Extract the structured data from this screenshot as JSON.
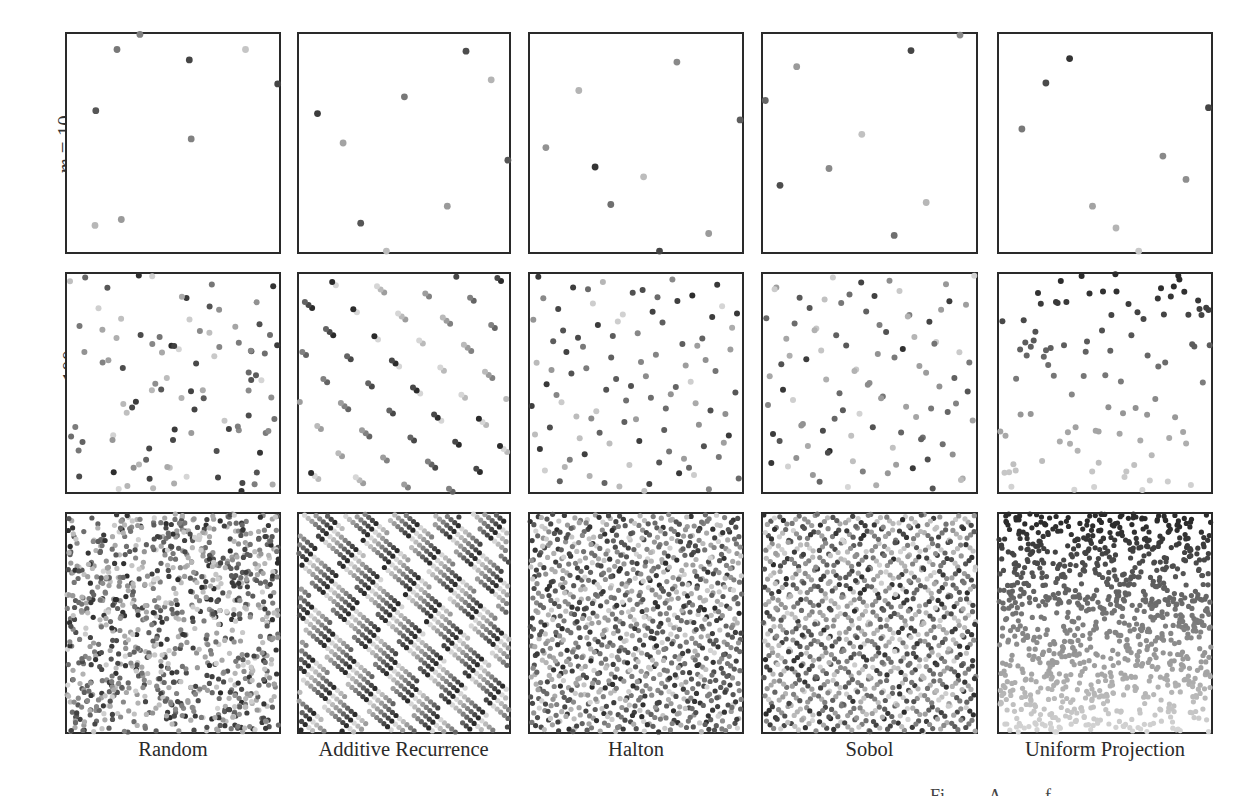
{
  "chart_data": {
    "type": "scatter",
    "title": "",
    "layout": "grid 3 rows x 5 columns of unit-square scatter plots",
    "grid": false,
    "axes": {
      "xlim": [
        0,
        1
      ],
      "ylim": [
        0,
        1
      ],
      "ticks": false
    },
    "color_encoding": "grayscale by sample index (light = early/low, dark = later/high)",
    "row_labels": [
      "m = 10",
      "m = 100",
      "m = 1000"
    ],
    "rows_m": [
      10,
      100,
      1000
    ],
    "column_labels": [
      "Random",
      "Additive Recurrence",
      "Halton",
      "Sobol",
      "Uniform Projection"
    ],
    "methods": [
      "random",
      "additive_recurrence",
      "halton",
      "sobol",
      "uniform_projection"
    ],
    "m10_points": {
      "Random": [
        [
          0.236,
          0.929,
          0.55
        ],
        [
          0.577,
          0.881,
          0.85
        ],
        [
          0.842,
          0.929,
          0.1
        ],
        [
          0.994,
          0.771,
          0.85
        ],
        [
          0.136,
          0.648,
          0.75
        ],
        [
          0.586,
          0.519,
          0.5
        ],
        [
          0.132,
          0.122,
          0.18
        ],
        [
          0.256,
          0.149,
          0.35
        ],
        [
          0.344,
          0.998,
          0.5
        ]
      ],
      "Additive Recurrence": [
        [
          0.795,
          0.921,
          0.8
        ],
        [
          0.915,
          0.79,
          0.2
        ],
        [
          0.502,
          0.712,
          0.55
        ],
        [
          0.088,
          0.635,
          0.9
        ],
        [
          0.21,
          0.5,
          0.3
        ],
        [
          0.995,
          0.421,
          0.75
        ],
        [
          0.706,
          0.21,
          0.35
        ],
        [
          0.294,
          0.132,
          0.75
        ],
        [
          0.416,
          0.004,
          0.15
        ]
      ],
      "Halton": [
        [
          0.693,
          0.871,
          0.45
        ],
        [
          0.23,
          0.741,
          0.2
        ],
        [
          0.991,
          0.606,
          0.7
        ],
        [
          0.075,
          0.479,
          0.4
        ],
        [
          0.307,
          0.39,
          0.95
        ],
        [
          0.536,
          0.345,
          0.15
        ],
        [
          0.381,
          0.218,
          0.6
        ],
        [
          0.843,
          0.085,
          0.35
        ],
        [
          0.611,
          0.004,
          0.85
        ]
      ],
      "Sobol": [
        [
          0.695,
          0.924,
          0.85
        ],
        [
          0.158,
          0.85,
          0.35
        ],
        [
          0.925,
          0.995,
          0.45
        ],
        [
          0.011,
          0.695,
          0.65
        ],
        [
          0.464,
          0.54,
          0.12
        ],
        [
          0.31,
          0.383,
          0.45
        ],
        [
          0.08,
          0.306,
          0.8
        ],
        [
          0.766,
          0.227,
          0.18
        ],
        [
          0.616,
          0.076,
          0.6
        ]
      ],
      "Uniform Projection": [
        [
          0.333,
          0.887,
          0.95
        ],
        [
          0.221,
          0.775,
          0.82
        ],
        [
          0.988,
          0.662,
          0.85
        ],
        [
          0.108,
          0.564,
          0.55
        ],
        [
          0.773,
          0.44,
          0.45
        ],
        [
          0.882,
          0.333,
          0.42
        ],
        [
          0.441,
          0.21,
          0.3
        ],
        [
          0.552,
          0.11,
          0.2
        ],
        [
          0.659,
          0.004,
          0.08
        ]
      ]
    },
    "point_colors": {
      "darkest": "#2b2b2b",
      "lightest": "#d6d6d6"
    },
    "frame_color": "#2a2a2a"
  },
  "labels": {
    "rows": [
      {
        "var": "m",
        "eq": " = 10"
      },
      {
        "var": "m",
        "eq": " = 100"
      },
      {
        "var": "m",
        "eq": " = 1000"
      }
    ],
    "columns": [
      "Random",
      "Additive Recurrence",
      "Halton",
      "Sobol",
      "Uniform Projection"
    ]
  },
  "caption_fragment": "Fi A f"
}
